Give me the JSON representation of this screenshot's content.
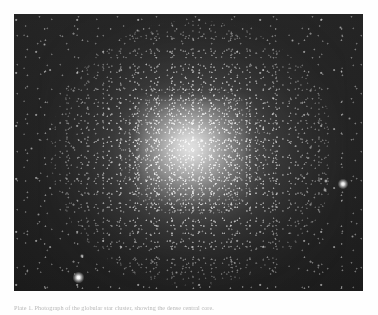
{
  "page": {
    "background_color": "#fefefe",
    "width": 378,
    "height": 315
  },
  "figure": {
    "name": "globular-cluster-photograph",
    "alt_description": "Black and white astronomical photograph of a dense globular star cluster",
    "plate": {
      "x": 14,
      "y": 14,
      "width": 349,
      "height": 277,
      "background_color": "#1a1a1a",
      "border_color": "#000000"
    },
    "cluster": {
      "label": "globular-cluster-core",
      "center_x": 195,
      "center_y": 152,
      "core_color": "#ffffff",
      "halo_color": "#8a8a8a",
      "sky_color": "#1e1e1e"
    },
    "field_stars": [
      {
        "name": "bright-star-lower-left",
        "x": 78,
        "y": 277,
        "size": 11,
        "brightness": 1.0
      },
      {
        "name": "bright-star-right",
        "x": 343,
        "y": 184,
        "size": 10,
        "brightness": 0.96
      },
      {
        "name": "star-left-of-bright-right",
        "x": 326,
        "y": 181,
        "size": 4,
        "brightness": 0.7
      },
      {
        "name": "star-left-of-bright-right-2",
        "x": 325,
        "y": 190,
        "size": 4,
        "brightness": 0.66
      },
      {
        "name": "star-above-lower-left",
        "x": 82,
        "y": 256,
        "size": 4,
        "brightness": 0.68
      },
      {
        "name": "star-upper-left",
        "x": 44,
        "y": 44,
        "size": 3,
        "brightness": 0.58
      },
      {
        "name": "star-upper-mid",
        "x": 137,
        "y": 30,
        "size": 3,
        "brightness": 0.55
      },
      {
        "name": "star-upper-right",
        "x": 292,
        "y": 40,
        "size": 3,
        "brightness": 0.56
      },
      {
        "name": "star-top-right-corner",
        "x": 340,
        "y": 27,
        "size": 3,
        "brightness": 0.52
      },
      {
        "name": "star-left-mid",
        "x": 31,
        "y": 148,
        "size": 3,
        "brightness": 0.54
      },
      {
        "name": "star-left-lower",
        "x": 38,
        "y": 214,
        "size": 3,
        "brightness": 0.5
      },
      {
        "name": "star-bottom-mid",
        "x": 176,
        "y": 272,
        "size": 3,
        "brightness": 0.52
      },
      {
        "name": "star-bottom-right",
        "x": 318,
        "y": 265,
        "size": 3,
        "brightness": 0.48
      },
      {
        "name": "star-right-lower",
        "x": 352,
        "y": 236,
        "size": 3,
        "brightness": 0.5
      },
      {
        "name": "star-right-upper",
        "x": 349,
        "y": 118,
        "size": 3,
        "brightness": 0.5
      },
      {
        "name": "star-mid-left-halo",
        "x": 108,
        "y": 108,
        "size": 3,
        "brightness": 0.6
      },
      {
        "name": "star-mid-right-halo",
        "x": 272,
        "y": 206,
        "size": 3,
        "brightness": 0.58
      }
    ]
  },
  "caption": {
    "name": "figure-caption",
    "text": "Plate 1. Photograph of the globular star cluster, showing the dense central core.",
    "color": "#b9b9b9",
    "truncated_at_page_edge": true
  }
}
